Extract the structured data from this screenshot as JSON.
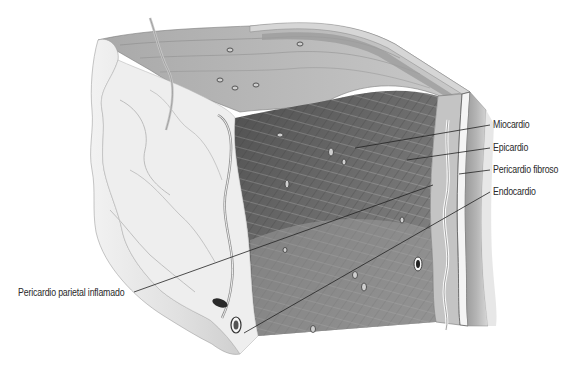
{
  "figure": {
    "labels": [
      {
        "id": "miocardio",
        "text": "Miocardio",
        "x": 493,
        "y": 119
      },
      {
        "id": "epicardio",
        "text": "Epicardio",
        "x": 493,
        "y": 142
      },
      {
        "id": "pericardio-fibroso",
        "text": "Pericardio fibroso",
        "x": 493,
        "y": 164
      },
      {
        "id": "endocardio",
        "text": "Endocardio",
        "x": 493,
        "y": 186
      },
      {
        "id": "pericardio-parietal-inflamado",
        "text": "Pericardio parietal inflamado",
        "x": 18,
        "y": 287
      }
    ],
    "colors": {
      "background": "#ffffff",
      "muscle_dark": "#5a5a5a",
      "muscle_mid": "#8a8a8a",
      "tissue_light": "#e6e6e6",
      "leader_line": "#222222",
      "label_text": "#2a2a2a"
    }
  }
}
